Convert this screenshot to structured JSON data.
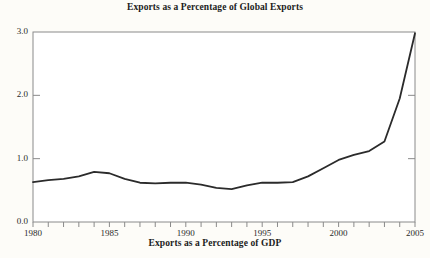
{
  "chart_data": {
    "type": "line",
    "title": "Exports as a Percentage of Global Exports",
    "xlabel": "Exports as a Percentage of GDP",
    "ylabel": "",
    "xlim": [
      1980,
      2005
    ],
    "ylim": [
      0.0,
      3.0
    ],
    "grid": false,
    "legend": null,
    "yticks": [
      "0.0",
      "1.0",
      "2.0",
      "3.0"
    ],
    "ytick_values": [
      0.0,
      1.0,
      2.0,
      3.0
    ],
    "xticks": [
      "1980",
      "1985",
      "1990",
      "1995",
      "2000",
      "2005"
    ],
    "xtick_values": [
      1980,
      1985,
      1990,
      1995,
      2000,
      2005
    ],
    "minor_xtick_interval": 1,
    "line_color": "#2b2b2b",
    "background_color": "#fdfcf8",
    "axis_color": "#8a8a8a",
    "x": [
      1980,
      1981,
      1982,
      1983,
      1984,
      1985,
      1986,
      1987,
      1988,
      1989,
      1990,
      1991,
      1992,
      1993,
      1994,
      1995,
      1996,
      1997,
      1998,
      1999,
      2000,
      2001,
      2002,
      2003,
      2004,
      2005
    ],
    "values": [
      0.63,
      0.66,
      0.68,
      0.72,
      0.79,
      0.77,
      0.68,
      0.62,
      0.61,
      0.62,
      0.62,
      0.59,
      0.54,
      0.52,
      0.58,
      0.62,
      0.62,
      0.63,
      0.72,
      0.85,
      0.98,
      1.06,
      1.12,
      1.27,
      1.95,
      2.98
    ]
  },
  "figure": {
    "title": "Exports as a Percentage of Global Exports",
    "caption": "Exports as a Percentage of GDP"
  }
}
